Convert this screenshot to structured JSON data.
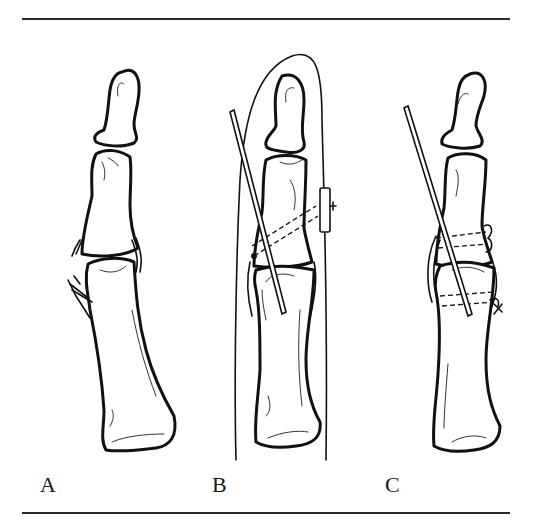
{
  "figure": {
    "type": "medical-illustration",
    "panels": [
      {
        "label": "A",
        "description": "injured joint with torn collateral ligament"
      },
      {
        "label": "B",
        "description": "K-wire fixation with pull-out suture tied over button, splint outline"
      },
      {
        "label": "C",
        "description": "K-wire fixation with transosseous suture through drill holes"
      }
    ],
    "colors": {
      "ink": "#111111",
      "background": "#ffffff",
      "rule": "#2a2a2a"
    }
  }
}
